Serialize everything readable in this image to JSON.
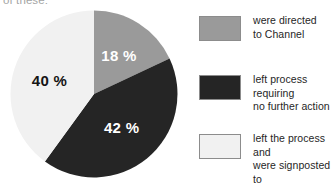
{
  "caption": "of these:",
  "colors": {
    "slice_directed": "#9a9a9a",
    "slice_left_no_action": "#252525",
    "slice_signposted": "#f1f1f1",
    "swatch_border": "#8c8c8c",
    "label_light": "#ffffff",
    "label_dark": "#151515",
    "background": "#ffffff"
  },
  "legend": {
    "items": [
      {
        "label": "were directed\nto Channel",
        "swatch_color": "#9a9a9a",
        "swatch_name": "legend-swatch-directed"
      },
      {
        "label": "left process requiring\nno further action",
        "swatch_color": "#252525",
        "swatch_name": "legend-swatch-no-action"
      },
      {
        "label": "left the process and\nwere signposted to\nalternative spaces",
        "swatch_color": "#f1f1f1",
        "swatch_name": "legend-swatch-signposted"
      }
    ]
  },
  "chart_data": {
    "type": "pie",
    "title": "",
    "start_angle_deg": 0,
    "direction": "clockwise",
    "labels": [
      "were directed to Channel",
      "left process requiring no further action",
      "left the process and were signposted to alternative spaces"
    ],
    "values": [
      18,
      42,
      40
    ],
    "value_labels": [
      "18 %",
      "42 %",
      "40 %"
    ],
    "value_unit": "%",
    "colors": [
      "#9a9a9a",
      "#252525",
      "#f1f1f1"
    ],
    "legend_position": "right",
    "grid": false,
    "total": 100
  }
}
